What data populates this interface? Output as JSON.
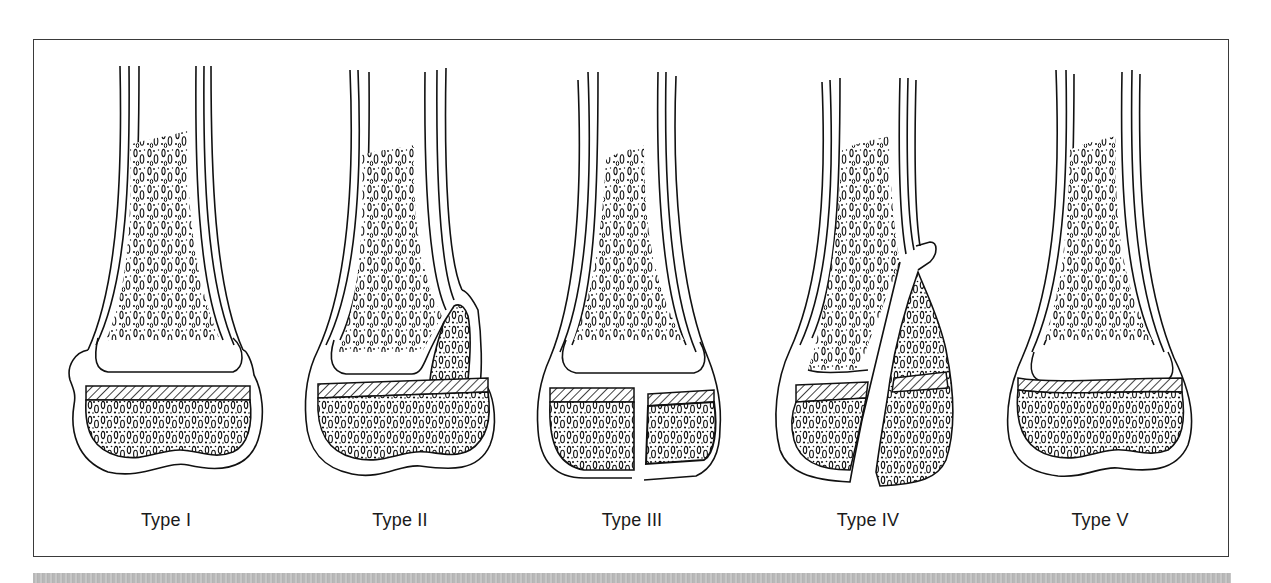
{
  "figure": {
    "panels": [
      {
        "label": "Type I",
        "fracture": "through physis"
      },
      {
        "label": "Type II",
        "fracture": "through physis and metaphysis"
      },
      {
        "label": "Type III",
        "fracture": "through physis and epiphysis"
      },
      {
        "label": "Type IV",
        "fracture": "through metaphysis, physis and epiphysis"
      },
      {
        "label": "Type V",
        "fracture": "compression of physis"
      }
    ]
  },
  "colors": {
    "line": "#111111",
    "frame": "#3a3a3a",
    "band": "#bdbdbd",
    "background": "#ffffff"
  }
}
